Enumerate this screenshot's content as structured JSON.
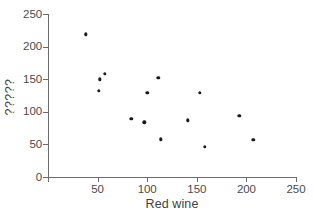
{
  "chart_data": {
    "type": "scatter",
    "title": "",
    "xlabel": "Red wine",
    "ylabel": "?????",
    "xlim": [
      0,
      250
    ],
    "ylim": [
      0,
      250
    ],
    "xticks": [
      0,
      50,
      100,
      150,
      200,
      250
    ],
    "yticks": [
      0,
      50,
      100,
      150,
      200,
      250
    ],
    "xticklabels": [
      "0",
      "50",
      "100",
      "150",
      "200",
      "250"
    ],
    "yticklabels": [
      "0",
      "50",
      "100",
      "150",
      "200",
      "250"
    ],
    "grid": false,
    "legend": null,
    "marker": {
      "shape": "circle",
      "color": "#1a1a1a",
      "size": 3.4
    },
    "axis_color": "#6b6b6b",
    "background": "#ffffff",
    "n_points": 14,
    "x": [
      38,
      51,
      52,
      57,
      84,
      97,
      100,
      111,
      114,
      141,
      153,
      158,
      193,
      207
    ],
    "y": [
      219,
      132,
      150,
      158,
      89,
      84,
      129,
      152,
      58,
      87,
      129,
      46,
      94,
      57
    ],
    "points": [
      {
        "x": 38,
        "y": 219
      },
      {
        "x": 51,
        "y": 132
      },
      {
        "x": 52,
        "y": 150
      },
      {
        "x": 57,
        "y": 158
      },
      {
        "x": 84,
        "y": 89
      },
      {
        "x": 97,
        "y": 84
      },
      {
        "x": 100,
        "y": 129
      },
      {
        "x": 111,
        "y": 152
      },
      {
        "x": 114,
        "y": 58
      },
      {
        "x": 141,
        "y": 87
      },
      {
        "x": 153,
        "y": 129
      },
      {
        "x": 158,
        "y": 46
      },
      {
        "x": 193,
        "y": 94
      },
      {
        "x": 207,
        "y": 57
      }
    ]
  }
}
